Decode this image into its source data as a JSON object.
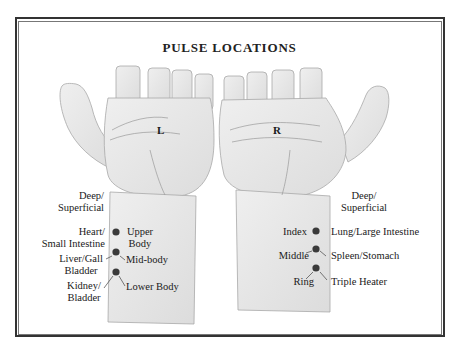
{
  "title": "PULSE LOCATIONS",
  "hands": {
    "left": {
      "letter": "L"
    },
    "right": {
      "letter": "R"
    }
  },
  "left_labels": {
    "depth": [
      "Deep/",
      "Superficial"
    ],
    "organs": [
      [
        "Heart/",
        "Small Intestine"
      ],
      [
        "Liver/Gall",
        "Bladder"
      ],
      [
        "Kidney/",
        "Bladder"
      ]
    ],
    "regions": [
      [
        "Upper",
        "Body"
      ],
      [
        "Mid-body"
      ],
      [
        "Lower Body"
      ]
    ]
  },
  "right_labels": {
    "depth": [
      "Deep/",
      "Superficial"
    ],
    "fingers": [
      "Index",
      "Middle",
      "Ring"
    ],
    "organs": [
      "Lung/Large Intestine",
      "Spleen/Stomach",
      "Triple Heater"
    ]
  },
  "colors": {
    "border": "#333333",
    "pulse_dot": "#3a3a3a",
    "skin_shade": "#d9d9d9"
  }
}
